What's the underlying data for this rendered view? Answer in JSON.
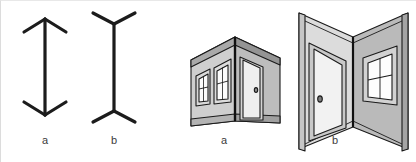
{
  "figure": {
    "width": 416,
    "height": 162,
    "background_color": "#ffffff"
  },
  "mueller_lyer": {
    "panel_name": "muller-lyer-figures",
    "line_color": "#1c1c1c",
    "stroke_width": 3.2,
    "figures": [
      {
        "id": "a",
        "label": "a",
        "label_x": 44,
        "label_y": 139,
        "description": "vertical shaft with inward arrowheads (fins pointing in)",
        "fin_direction": "inward",
        "shaft_x": 44,
        "shaft_top_y": 18,
        "shaft_bottom_y": 114,
        "fin_length": 24,
        "fin_spread_x": 21,
        "fin_drop_y": 12
      },
      {
        "id": "b",
        "label": "b",
        "label_x": 113,
        "label_y": 139,
        "description": "vertical shaft with outward fins (arrow tails pointing out)",
        "fin_direction": "outward",
        "shaft_x": 113,
        "shaft_top_y": 23,
        "shaft_bottom_y": 110,
        "fin_length": 24,
        "fin_spread_x": 21,
        "fin_drop_y": 12
      }
    ]
  },
  "corners": {
    "panel_name": "carpentered-corner-illustrations",
    "outline_color": "#1a1a1a",
    "wall_light": "#e2e2e2",
    "wall_mid": "#c9c9c9",
    "wall_dark": "#a8a8a8",
    "wall_darker": "#8f8f8f",
    "door_face": "#efefef",
    "glass_color": "#fdfdfd",
    "figures": [
      {
        "id": "a",
        "label": "a",
        "label_x": 41,
        "label_y": 139,
        "description": "convex / outside building corner seen from outside, two windows on left face and a door on right face",
        "corner_type": "convex",
        "features": [
          "window",
          "window",
          "door",
          "doorknob"
        ]
      },
      {
        "id": "b",
        "label": "b",
        "label_x": 152,
        "label_y": 139,
        "description": "concave / inside room corner, door on left wall and window on right wall",
        "corner_type": "concave",
        "features": [
          "door",
          "doorknob",
          "window"
        ]
      }
    ]
  }
}
